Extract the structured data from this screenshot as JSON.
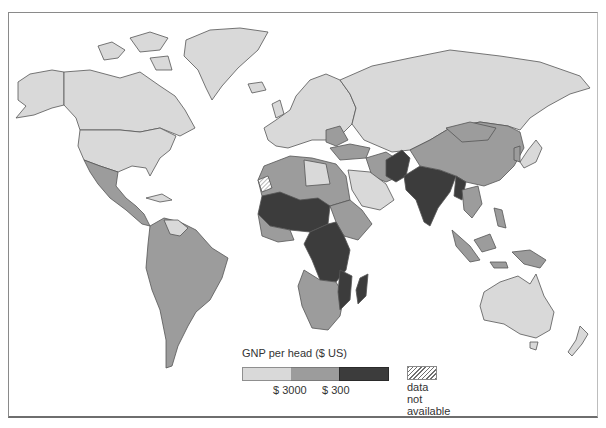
{
  "map": {
    "title": "GNP per head ($ US)",
    "type": "choropleth world map",
    "colors": {
      "high": "#d9d9d9",
      "middle": "#9c9c9c",
      "low": "#3c3c3c",
      "border": "#555555",
      "no_data_hatch": "#6f6f6f",
      "background": "#ffffff"
    }
  },
  "legend": {
    "title": "GNP per head ($ US)",
    "classes": [
      {
        "name": "above $3000",
        "color": "#d9d9d9"
      },
      {
        "name": "$300 to $3000",
        "color": "#9c9c9c"
      },
      {
        "name": "below $300",
        "color": "#3c3c3c"
      }
    ],
    "tick_labels": [
      "$ 3000",
      "$ 300"
    ],
    "no_data": {
      "label_lines": [
        "data",
        "not",
        "available"
      ]
    }
  },
  "regions": {
    "high": [
      "North America",
      "Greenland",
      "Europe",
      "Soviet Union",
      "Japan",
      "Australia",
      "New Zealand",
      "Saudi Arabia",
      "Libya",
      "Venezuela"
    ],
    "middle": [
      "Mexico",
      "Central America",
      "South America",
      "North Africa",
      "Southern Africa",
      "Middle East",
      "China",
      "Mongolia",
      "Southeast Asia",
      "Indonesia",
      "Papua New Guinea"
    ],
    "low": [
      "Sahel",
      "Central Africa",
      "East Africa",
      "Madagascar",
      "India",
      "Pakistan",
      "Afghanistan",
      "Bangladesh",
      "Burma"
    ],
    "no_data": [
      "Western Sahara"
    ]
  }
}
